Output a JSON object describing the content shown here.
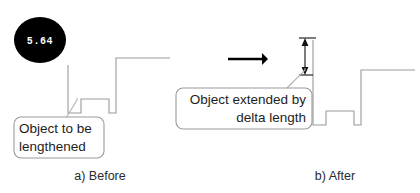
{
  "figure": {
    "width": 420,
    "height": 193,
    "background_color": "#ffffff",
    "line_color": "#9a9a9a",
    "accent_color": "#000000"
  },
  "badge": {
    "label": "5.64",
    "shape": "filled-circle",
    "fill_color": "#000000",
    "text_color": "#ffffff",
    "cx": 40,
    "cy": 40,
    "rx": 26,
    "ry": 23
  },
  "panels": [
    {
      "id": "before",
      "caption": "a)  Before",
      "caption_x": 100,
      "caption_y": 180,
      "callout": {
        "lines": [
          "Object to be",
          "lengthened"
        ],
        "align": "left",
        "x": 14,
        "y": 117,
        "width": 90,
        "height": 41
      }
    },
    {
      "id": "after",
      "caption": "b)  After",
      "caption_x": 335,
      "caption_y": 180,
      "callout": {
        "lines": [
          "Object extended by",
          "delta length"
        ],
        "align": "right",
        "x": 176,
        "y": 88,
        "width": 136,
        "height": 41
      }
    }
  ],
  "annotations": {
    "move_arrow": {
      "name": "transformation-arrow",
      "x1": 228,
      "y1": 59,
      "x2": 268,
      "y2": 59,
      "color": "#000000"
    },
    "delta_dimension": {
      "name": "delta-length-dimension",
      "x": 305,
      "y_top": 40,
      "y_bottom": 73,
      "color": "#111111"
    }
  },
  "chart_data": {
    "type": "diagram",
    "before_profile": [
      [
        68,
        65
      ],
      [
        68,
        113
      ],
      [
        81,
        113
      ],
      [
        81,
        99
      ],
      [
        109,
        99
      ],
      [
        109,
        113
      ],
      [
        116,
        113
      ],
      [
        116,
        58
      ],
      [
        170,
        58
      ]
    ],
    "after_profile": [
      [
        313,
        40
      ],
      [
        313,
        125
      ],
      [
        326,
        125
      ],
      [
        326,
        111
      ],
      [
        354,
        111
      ],
      [
        354,
        125
      ],
      [
        361,
        125
      ],
      [
        361,
        70
      ],
      [
        415,
        70
      ]
    ]
  }
}
